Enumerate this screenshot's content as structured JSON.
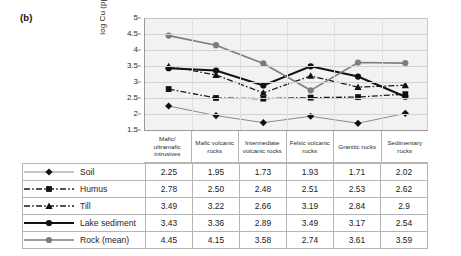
{
  "figure": {
    "panel_label": "(b)"
  },
  "chart_data": {
    "type": "line",
    "title": "",
    "xlabel": "",
    "ylabel": "log Cu (ppm)",
    "ylim": [
      1.5,
      5
    ],
    "ytick_labels": [
      "5",
      "4.5",
      "4",
      "3.5",
      "3",
      "2.5",
      "2",
      "1.5"
    ],
    "ytick_values": [
      5,
      4.5,
      4,
      3.5,
      3,
      2.5,
      2,
      1.5
    ],
    "grid": true,
    "legend_position": "table-left-column",
    "categories": [
      "Mafic/ ultramafic intrusives",
      "Mafic volcanic rocks",
      "Intermediate volcanic rocks",
      "Felsic volcanic rocks",
      "Granitic rocks",
      "Sedimentary rocks"
    ],
    "series": [
      {
        "name": "Soil",
        "values": [
          2.25,
          1.95,
          1.73,
          1.93,
          1.71,
          2.02
        ],
        "labels": [
          "2.25",
          "1.95",
          "1.73",
          "1.93",
          "1.71",
          "2.02"
        ],
        "marker": "diamond",
        "line_style": "solid-thin",
        "color": "#6f6f6f",
        "marker_color": "#111111"
      },
      {
        "name": "Humus",
        "values": [
          2.78,
          2.5,
          2.48,
          2.51,
          2.53,
          2.62
        ],
        "labels": [
          "2.78",
          "2.50",
          "2.48",
          "2.51",
          "2.53",
          "2.62"
        ],
        "marker": "square",
        "line_style": "dash-dot",
        "color": "#1a1a1a",
        "marker_color": "#111111"
      },
      {
        "name": "Till",
        "values": [
          3.49,
          3.22,
          2.66,
          3.19,
          2.84,
          2.9
        ],
        "labels": [
          "3.49",
          "3.22",
          "2.66",
          "3.19",
          "2.84",
          "2.9"
        ],
        "marker": "triangle",
        "line_style": "dash-dot",
        "color": "#1a1a1a",
        "marker_color": "#111111"
      },
      {
        "name": "Lake sediment",
        "values": [
          3.43,
          3.36,
          2.89,
          3.49,
          3.17,
          2.54
        ],
        "labels": [
          "3.43",
          "3.36",
          "2.89",
          "3.49",
          "3.17",
          "2.54"
        ],
        "marker": "circle",
        "line_style": "solid-thick",
        "color": "#111111",
        "marker_color": "#111111"
      },
      {
        "name": "Rock (mean)",
        "values": [
          4.45,
          4.15,
          3.58,
          2.74,
          3.61,
          3.59
        ],
        "labels": [
          "4.45",
          "4.15",
          "3.58",
          "2.74",
          "3.61",
          "3.59"
        ],
        "marker": "circle",
        "line_style": "solid-medium",
        "color": "#7d7d7d",
        "marker_color": "#7d7d7d"
      }
    ]
  },
  "table": {
    "rows": [
      {
        "label": "Soil",
        "values": [
          "2.25",
          "1.95",
          "1.73",
          "1.93",
          "1.71",
          "2.02"
        ]
      },
      {
        "label": "Humus",
        "values": [
          "2.78",
          "2.50",
          "2.48",
          "2.51",
          "2.53",
          "2.62"
        ]
      },
      {
        "label": "Till",
        "values": [
          "3.49",
          "3.22",
          "2.66",
          "3.19",
          "2.84",
          "2.9"
        ]
      },
      {
        "label": "Lake sediment",
        "values": [
          "3.43",
          "3.36",
          "2.89",
          "3.49",
          "3.17",
          "2.54"
        ]
      },
      {
        "label": "Rock (mean)",
        "values": [
          "4.45",
          "4.15",
          "3.58",
          "2.74",
          "3.61",
          "3.59"
        ]
      }
    ]
  }
}
